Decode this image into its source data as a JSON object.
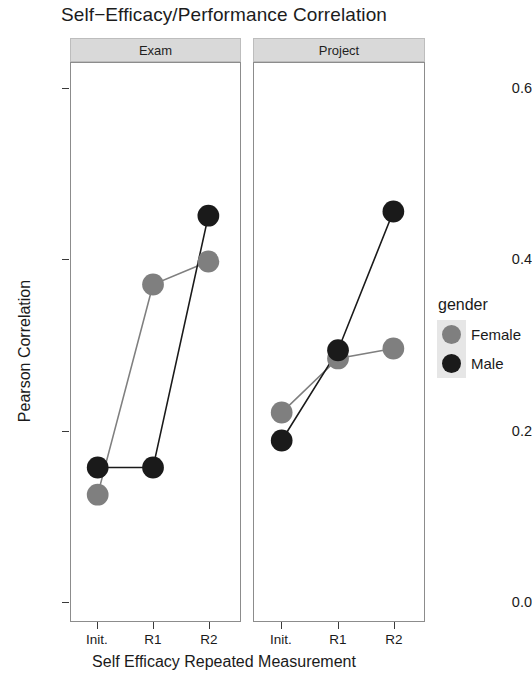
{
  "chart_data": {
    "type": "line",
    "title": "Self−Efficacy/Performance Correlation",
    "xlabel": "Self Efficacy Repeated Measurement",
    "ylabel": "Pearson Correlation",
    "categories": [
      "Init.",
      "R1",
      "R2"
    ],
    "ylim": [
      -0.02,
      0.66
    ],
    "yticks": [
      0.0,
      0.2,
      0.4,
      0.6
    ],
    "ytick_labels": [
      "0.0",
      "0.2",
      "0.4",
      "0.6"
    ],
    "grid": false,
    "legend": {
      "title": "gender",
      "position": "right",
      "entries": [
        {
          "name": "Female",
          "color": "#7f7f7f"
        },
        {
          "name": "Male",
          "color": "#1a1a1a"
        }
      ]
    },
    "facet_variable": "assessment",
    "panels": [
      {
        "label": "Exam",
        "series": [
          {
            "name": "Female",
            "color": "#7f7f7f",
            "values": [
              0.134,
              0.39,
              0.418
            ]
          },
          {
            "name": "Male",
            "color": "#1a1a1a",
            "values": [
              0.167,
              0.167,
              0.474
            ]
          }
        ]
      },
      {
        "label": "Project",
        "series": [
          {
            "name": "Female",
            "color": "#7f7f7f",
            "values": [
              0.234,
              0.3,
              0.312
            ]
          },
          {
            "name": "Male",
            "color": "#1a1a1a",
            "values": [
              0.2,
              0.31,
              0.479
            ]
          }
        ]
      }
    ]
  },
  "colors": {
    "female": "#7f7f7f",
    "male": "#1a1a1a",
    "strip_background": "#d9d9d9",
    "panel_border": "#8c8c8c",
    "legend_key_background": "#e6e6e6"
  }
}
